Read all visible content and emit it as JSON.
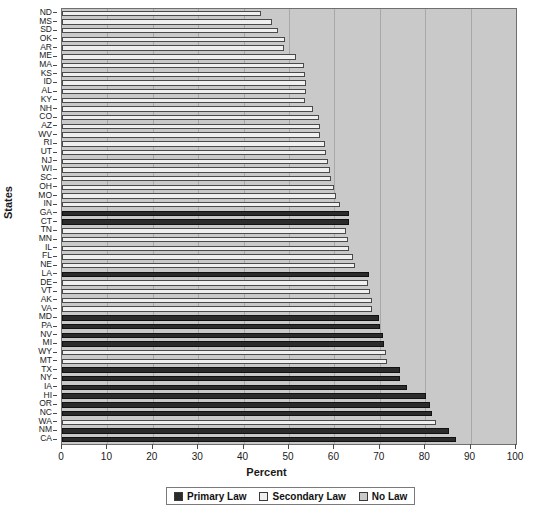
{
  "chart_data": {
    "type": "bar",
    "orientation": "horizontal",
    "stacked": true,
    "title": "",
    "xlabel": "Percent",
    "ylabel": "States",
    "xlim": [
      0,
      100
    ],
    "xticks": [
      0,
      10,
      20,
      30,
      40,
      50,
      60,
      70,
      80,
      90,
      100
    ],
    "xticklabels": [
      "0",
      "10",
      "20",
      "30",
      "40",
      "50",
      "60",
      "70",
      "80",
      "90",
      "100"
    ],
    "grid": true,
    "grid_axis": "x",
    "legend_position": "bottom",
    "legend": [
      {
        "label": "Primary Law",
        "color": "#2b2b2b"
      },
      {
        "label": "Secondary Law",
        "color": "#efefef"
      },
      {
        "label": "No Law",
        "color": "#c9c9c9"
      }
    ],
    "categories": [
      "ND",
      "MS",
      "SD",
      "OK",
      "AR",
      "ME",
      "MA",
      "KS",
      "ID",
      "AL",
      "KY",
      "NH",
      "CO",
      "AZ",
      "WV",
      "RI",
      "UT",
      "NJ",
      "WI",
      "SC",
      "OH",
      "MO",
      "IN",
      "GA",
      "CT",
      "TN",
      "MN",
      "IL",
      "FL",
      "NE",
      "LA",
      "DE",
      "VT",
      "AK",
      "VA",
      "MD",
      "PA",
      "NV",
      "MI",
      "WY",
      "MT",
      "TX",
      "NY",
      "IA",
      "HI",
      "OR",
      "NC",
      "WA",
      "NM",
      "CA"
    ],
    "law_type": [
      "Secondary Law",
      "Secondary Law",
      "Secondary Law",
      "Secondary Law",
      "Secondary Law",
      "Secondary Law",
      "Secondary Law",
      "Secondary Law",
      "Secondary Law",
      "Secondary Law",
      "Secondary Law",
      "Secondary Law",
      "Secondary Law",
      "Secondary Law",
      "Secondary Law",
      "Secondary Law",
      "Secondary Law",
      "Secondary Law",
      "Secondary Law",
      "Secondary Law",
      "Secondary Law",
      "Secondary Law",
      "Secondary Law",
      "Primary Law",
      "Primary Law",
      "Secondary Law",
      "Secondary Law",
      "Secondary Law",
      "Secondary Law",
      "Secondary Law",
      "Primary Law",
      "Secondary Law",
      "Secondary Law",
      "Secondary Law",
      "Secondary Law",
      "Primary Law",
      "Primary Law",
      "Primary Law",
      "Primary Law",
      "Secondary Law",
      "Secondary Law",
      "Primary Law",
      "Primary Law",
      "Primary Law",
      "Primary Law",
      "Primary Law",
      "Primary Law",
      "Secondary Law",
      "Primary Law",
      "Primary Law"
    ],
    "values": [
      43.8,
      46.2,
      47.6,
      49.1,
      49.0,
      51.5,
      53.2,
      53.6,
      53.8,
      53.8,
      53.6,
      55.3,
      56.7,
      56.8,
      56.8,
      58.0,
      58.1,
      58.5,
      59.0,
      59.2,
      60.0,
      60.3,
      61.3,
      63.2,
      63.2,
      62.6,
      62.9,
      63.2,
      64.0,
      64.6,
      67.6,
      67.5,
      67.8,
      68.2,
      68.3,
      69.8,
      70.1,
      70.6,
      71.0,
      71.4,
      71.6,
      74.4,
      74.5,
      76.0,
      80.2,
      81.0,
      81.6,
      82.3,
      85.2,
      86.8
    ],
    "units": "percent"
  },
  "legend": {
    "items": [
      {
        "label": "Primary Law",
        "swatch": "primary"
      },
      {
        "label": "Secondary Law",
        "swatch": "secondary"
      },
      {
        "label": "No Law",
        "swatch": "nolaw"
      }
    ]
  },
  "colors": {
    "primary": "#2b2b2b",
    "secondary": "#efefef",
    "nolaw": "#c9c9c9",
    "axis": "#4a4a4a",
    "grid": "#a8a8a8",
    "text": "#1a1a1a"
  }
}
